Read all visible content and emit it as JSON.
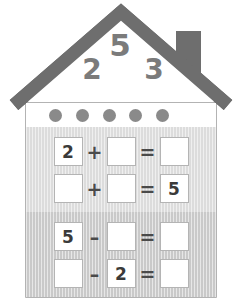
{
  "worksheet": {
    "title": "Number bond house worksheet for 5",
    "house": {
      "roof_color": "#6e6e6e",
      "chimney_color": "#6e6e6e",
      "wall_color": "#ffffff",
      "wall_border_color": "#9a9a9a"
    },
    "roof_numbers": {
      "top": "5",
      "left": "2",
      "right": "3",
      "color": "#7b7b7b"
    },
    "dot_band": {
      "dot_color": "#8a8a8a",
      "dot_count": 5,
      "dots": [
        "dot",
        "dot",
        "dot",
        "dot",
        "dot"
      ]
    },
    "panels": [
      {
        "id": "addition",
        "background_color": "#dcdcdc",
        "rows": [
          {
            "id": "add-row-1",
            "cells": [
              {
                "value": "2",
                "filled": true
              },
              {
                "value": "+",
                "operator": true
              },
              {
                "value": "",
                "filled": false
              },
              {
                "value": "=",
                "operator": true
              },
              {
                "value": "",
                "filled": false
              }
            ]
          },
          {
            "id": "add-row-2",
            "cells": [
              {
                "value": "",
                "filled": false
              },
              {
                "value": "+",
                "operator": true
              },
              {
                "value": "",
                "filled": false
              },
              {
                "value": "=",
                "operator": true
              },
              {
                "value": "5",
                "filled": true
              }
            ]
          }
        ]
      },
      {
        "id": "subtraction",
        "background_color": "#c9c9c9",
        "rows": [
          {
            "id": "sub-row-1",
            "cells": [
              {
                "value": "5",
                "filled": true
              },
              {
                "value": "–",
                "operator": true
              },
              {
                "value": "",
                "filled": false
              },
              {
                "value": "=",
                "operator": true
              },
              {
                "value": "",
                "filled": false
              }
            ]
          },
          {
            "id": "sub-row-2",
            "cells": [
              {
                "value": "",
                "filled": false
              },
              {
                "value": "–",
                "operator": true
              },
              {
                "value": "2",
                "filled": true
              },
              {
                "value": "=",
                "operator": true
              },
              {
                "value": "",
                "filled": false
              }
            ]
          }
        ]
      }
    ]
  }
}
